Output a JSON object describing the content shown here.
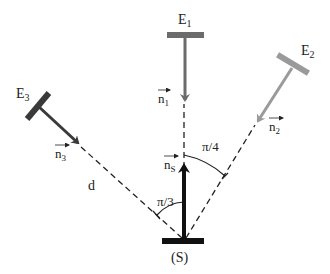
{
  "diagram": {
    "type": "physics-geometry",
    "source": {
      "label": "(S)",
      "vector_label": "n",
      "vector_sub": "S",
      "color": "#111111"
    },
    "mirrors": [
      {
        "id": "E1",
        "label": "E",
        "sub": "1",
        "vector_label": "n",
        "vector_sub": "1",
        "color": "#6b6b6b"
      },
      {
        "id": "E2",
        "label": "E",
        "sub": "2",
        "vector_label": "n",
        "vector_sub": "2",
        "color": "#9a9a9a"
      },
      {
        "id": "E3",
        "label": "E",
        "sub": "3",
        "vector_label": "n",
        "vector_sub": "3",
        "color": "#3a3a3a"
      }
    ],
    "angles": [
      {
        "label": "π/3",
        "between": [
          "n_S",
          "E3 direction"
        ]
      },
      {
        "label": "π/4",
        "between": [
          "n_S",
          "E2 direction"
        ]
      }
    ],
    "distance_label": "d",
    "line_style": {
      "dashed_color": "#222222"
    }
  }
}
